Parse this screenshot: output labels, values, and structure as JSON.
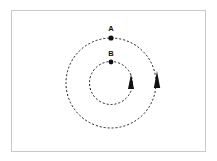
{
  "figure": {
    "background_color": "#ffffff",
    "frame": {
      "border_color": "#c9c9c9",
      "x": 11,
      "y": 10,
      "width": 195,
      "height": 142
    },
    "center": {
      "x": 111,
      "y": 83
    },
    "stroke_color": "#1a1a1a",
    "marker_color": "#111111"
  },
  "orbits": [
    {
      "id": "outer-orbit",
      "name": "outer-orbit",
      "radius": 45,
      "style": "dashed",
      "dash_pattern": "2,2",
      "body": {
        "label": "A",
        "label_x": 111,
        "label_y": 31,
        "dot_x": 111,
        "dot_y": 38,
        "dot_radius": 2.6
      },
      "arrow": {
        "direction": "counterclockwise",
        "tip_x": 157,
        "tip_y": 71,
        "base_y": 88,
        "half_width": 3.2
      }
    },
    {
      "id": "inner-orbit",
      "name": "inner-orbit",
      "radius": 21.5,
      "style": "dashed",
      "dash_pattern": "2,2",
      "body": {
        "label": "B",
        "label_x": 111,
        "label_y": 56,
        "dot_x": 111,
        "dot_y": 62,
        "dot_radius": 2.4
      },
      "arrow": {
        "direction": "counterclockwise",
        "tip_x": 131,
        "tip_y": 74,
        "base_y": 89,
        "half_width": 3.0
      }
    }
  ],
  "chart_data": {
    "type": "scatter",
    "title": "",
    "xlabel": "",
    "ylabel": "",
    "center": {
      "x": 111,
      "y": 83
    },
    "series": [
      {
        "name": "A",
        "orbit_radius": 45,
        "x": 111,
        "y": 38,
        "angle_deg": 90
      },
      {
        "name": "B",
        "orbit_radius": 21.5,
        "x": 111,
        "y": 62,
        "angle_deg": 90
      }
    ],
    "annotations": [
      "A",
      "B"
    ],
    "legend": "none",
    "grid": false
  }
}
